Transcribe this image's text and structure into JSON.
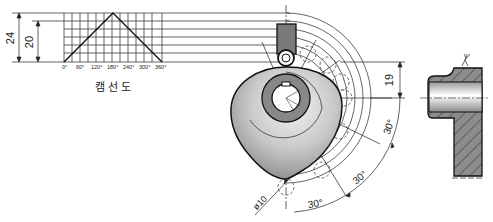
{
  "diagram": {
    "caption": "캠선도",
    "graph": {
      "x_ticks": [
        "0°",
        "60°",
        "120°",
        "180°",
        "240°",
        "300°",
        "360°"
      ],
      "dim_total": "24",
      "dim_rise": "20"
    },
    "cam": {
      "dim_base": "19",
      "angle_labels": [
        "30°",
        "30°",
        "30°"
      ],
      "roller_dia": "ø10"
    },
    "section": {
      "surface_mark": "y"
    },
    "colors": {
      "line": "#222222",
      "cam_fill_dark": "#8a8a8a",
      "cam_fill_light": "#f2f2f2",
      "hatch_fill": "#8c8c8c"
    }
  }
}
